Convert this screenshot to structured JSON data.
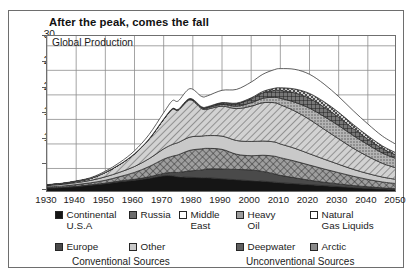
{
  "figure": {
    "title": "After the peak, comes the fall",
    "panel_label": "Global Production"
  },
  "chart_data": {
    "type": "area",
    "stacked": true,
    "title": "After the peak, comes the fall",
    "subtitle": "Global Production",
    "xlabel": "",
    "ylabel": "Billions of barrels per year",
    "xlim": [
      1930,
      2050
    ],
    "ylim": [
      0,
      32
    ],
    "yticks": [
      0,
      5,
      10,
      15,
      20,
      25,
      30
    ],
    "xticks": [
      1930,
      1940,
      1950,
      1960,
      1970,
      1980,
      1990,
      2000,
      2010,
      2020,
      2030,
      2040,
      2050
    ],
    "grid": true,
    "legend_position": "bottom",
    "x": [
      1930,
      1935,
      1940,
      1945,
      1950,
      1955,
      1960,
      1965,
      1970,
      1973,
      1975,
      1979,
      1983,
      1985,
      1990,
      1995,
      2000,
      2004,
      2008,
      2010,
      2015,
      2020,
      2025,
      2030,
      2035,
      2040,
      2045,
      2050
    ],
    "series": [
      {
        "name": "Continental U.S.A",
        "swatch": "solid-black",
        "color": "#151515",
        "group": "Conventional Sources",
        "values": [
          1.0,
          1.1,
          1.3,
          1.6,
          1.9,
          2.3,
          2.6,
          3.0,
          3.5,
          3.5,
          3.3,
          3.2,
          3.1,
          3.1,
          2.9,
          2.7,
          2.5,
          2.4,
          2.2,
          2.1,
          1.9,
          1.7,
          1.5,
          1.3,
          1.1,
          0.95,
          0.8,
          0.7
        ]
      },
      {
        "name": "Europe",
        "swatch": "solid-dark-gray",
        "color": "#4a4a4a",
        "group": "Conventional Sources",
        "values": [
          0.05,
          0.05,
          0.06,
          0.08,
          0.1,
          0.15,
          0.2,
          0.3,
          0.5,
          0.7,
          0.9,
          1.3,
          1.6,
          1.8,
          2.0,
          2.1,
          2.2,
          2.0,
          1.7,
          1.5,
          1.2,
          0.9,
          0.7,
          0.55,
          0.42,
          0.32,
          0.25,
          0.2
        ]
      },
      {
        "name": "Russia",
        "swatch": "crosshatch-dark",
        "color": "#6d6d6d",
        "group": "Conventional Sources",
        "values": [
          0.2,
          0.25,
          0.35,
          0.4,
          0.6,
          0.9,
          1.4,
          2.1,
          2.9,
          3.3,
          3.6,
          4.2,
          4.3,
          4.2,
          4.0,
          3.1,
          2.9,
          3.3,
          3.6,
          3.6,
          3.4,
          3.1,
          2.7,
          2.3,
          1.9,
          1.5,
          1.2,
          1.0
        ]
      },
      {
        "name": "Other",
        "swatch": "light-gray",
        "color": "#c9c9c9",
        "group": "Conventional Sources",
        "values": [
          0.3,
          0.35,
          0.4,
          0.5,
          0.7,
          0.9,
          1.2,
          1.6,
          2.1,
          2.4,
          2.5,
          2.7,
          2.6,
          2.6,
          2.7,
          2.8,
          2.9,
          2.9,
          2.9,
          2.8,
          2.6,
          2.3,
          2.0,
          1.7,
          1.4,
          1.2,
          1.0,
          0.85
        ]
      },
      {
        "name": "Middle East",
        "swatch": "diagonal-hatch",
        "color": "#b9b9b9",
        "group": "Conventional Sources",
        "values": [
          0.1,
          0.15,
          0.25,
          0.4,
          0.9,
          1.6,
          2.6,
          4.0,
          6.0,
          7.2,
          6.6,
          7.6,
          5.6,
          5.4,
          6.1,
          6.5,
          7.2,
          7.8,
          8.0,
          8.0,
          7.6,
          7.0,
          6.1,
          5.2,
          4.3,
          3.5,
          2.8,
          2.3
        ]
      },
      {
        "name": "Heavy Oil",
        "swatch": "fine-dot-gray",
        "color": "#9c9c9c",
        "group": "Unconventional Sources",
        "values": [
          0,
          0,
          0,
          0,
          0,
          0,
          0,
          0.02,
          0.05,
          0.08,
          0.1,
          0.15,
          0.2,
          0.25,
          0.35,
          0.5,
          0.7,
          0.9,
          1.1,
          1.3,
          1.8,
          2.3,
          2.6,
          2.7,
          2.6,
          2.4,
          2.1,
          1.9
        ]
      },
      {
        "name": "Deepwater",
        "swatch": "dark-crosshatch",
        "color": "#5f5f5f",
        "group": "Unconventional Sources",
        "values": [
          0,
          0,
          0,
          0,
          0,
          0,
          0,
          0,
          0.02,
          0.04,
          0.06,
          0.1,
          0.15,
          0.2,
          0.3,
          0.5,
          0.8,
          1.1,
          1.4,
          1.6,
          1.9,
          2.0,
          1.9,
          1.7,
          1.4,
          1.1,
          0.9,
          0.7
        ]
      },
      {
        "name": "Arctic",
        "swatch": "checker-gray",
        "color": "#8a8a8a",
        "group": "Unconventional Sources",
        "values": [
          0,
          0,
          0,
          0,
          0,
          0,
          0,
          0,
          0,
          0,
          0,
          0.02,
          0.03,
          0.05,
          0.08,
          0.12,
          0.2,
          0.3,
          0.45,
          0.55,
          0.8,
          1.0,
          1.1,
          1.0,
          0.85,
          0.7,
          0.55,
          0.45
        ]
      },
      {
        "name": "Natural Gas Liquids",
        "swatch": "white",
        "color": "#ffffff",
        "group": "Unconventional Sources",
        "values": [
          0.05,
          0.08,
          0.1,
          0.15,
          0.25,
          0.4,
          0.6,
          0.9,
          1.3,
          1.6,
          1.7,
          2.0,
          2.1,
          2.2,
          2.5,
          2.8,
          3.2,
          3.5,
          3.8,
          3.9,
          4.0,
          3.9,
          3.6,
          3.2,
          2.8,
          2.4,
          2.0,
          1.7
        ]
      }
    ]
  },
  "axes": {
    "ylabel": "Billions of barrels per year",
    "yticks": [
      "30",
      "25",
      "20",
      "15",
      "10",
      "5",
      "0"
    ],
    "xticks": [
      "1930",
      "1940",
      "1950",
      "1960",
      "1970",
      "1980",
      "1990",
      "2000",
      "2010",
      "2020",
      "2030",
      "2040",
      "2050"
    ]
  },
  "legend": {
    "left_items": [
      {
        "label": "Continental\nU.S.A",
        "swatch": "solid-black"
      },
      {
        "label": "Russia",
        "swatch": "crosshatch-dark"
      },
      {
        "label": "Middle\nEast",
        "swatch": "white"
      },
      {
        "label": "Europe",
        "swatch": "solid-dark-gray"
      },
      {
        "label": "Other",
        "swatch": "light-gray"
      }
    ],
    "right_items": [
      {
        "label": "Heavy\nOil",
        "swatch": "fine-dot-gray"
      },
      {
        "label": "Natural\nGas Liquids",
        "swatch": "white"
      },
      {
        "label": "Deepwater",
        "swatch": "dark-crosshatch"
      },
      {
        "label": "Arctic",
        "swatch": "checker-gray"
      }
    ],
    "left_caption": "Conventional Sources",
    "right_caption": "Unconventional Sources"
  }
}
